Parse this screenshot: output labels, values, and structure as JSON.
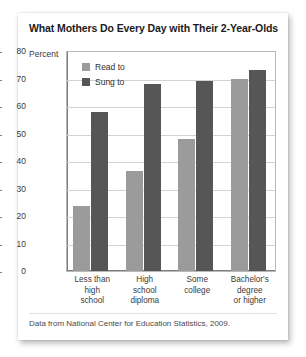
{
  "card": {
    "title": "What Mothers Do Every Day with Their 2-Year-Olds",
    "axis_caption": "Percent",
    "footnote": "Data from National Center for Education Statistics, 2009."
  },
  "legend": {
    "items": [
      {
        "label": "Read to",
        "color": "#9b9b9b",
        "key": "read"
      },
      {
        "label": "Sung to",
        "color": "#565656",
        "key": "sung"
      }
    ]
  },
  "xlabels": [
    {
      "line1": "Less than",
      "line2": "high",
      "line3": "school"
    },
    {
      "line1": "High",
      "line2": "school",
      "line3": "diploma"
    },
    {
      "line1": "Some",
      "line2": "college",
      "line3": ""
    },
    {
      "line1": "Bachelor's",
      "line2": "degree",
      "line3": "or higher"
    }
  ],
  "yticks": [
    "80",
    "70",
    "60",
    "50",
    "40",
    "30",
    "20",
    "10",
    "0"
  ],
  "chart_data": {
    "type": "bar",
    "title": "What Mothers Do Every Day with Their 2-Year-Olds",
    "subtitle": "",
    "xlabel": "",
    "ylabel": "Percent",
    "ylim": [
      0,
      80
    ],
    "ytick_step": 10,
    "grid": true,
    "legend_position": "top-left-inside",
    "categories": [
      "Less than high school",
      "High school diploma",
      "Some college",
      "Bachelor's degree or higher"
    ],
    "series": [
      {
        "name": "Read to",
        "color": "#9b9b9b",
        "values": [
          23.5,
          36.5,
          48,
          70
        ]
      },
      {
        "name": "Sung to",
        "color": "#565656",
        "values": [
          58,
          68,
          69,
          73
        ]
      }
    ],
    "source": "Data from National Center for Education Statistics, 2009."
  }
}
